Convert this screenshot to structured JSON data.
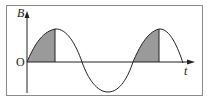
{
  "figure": {
    "y_axis_label": "B",
    "x_axis_label": "t",
    "origin_label": "O",
    "curve": "sine wave",
    "shaded_regions": [
      {
        "from": "0",
        "to": "T/4",
        "description": "first quarter period, B rising from 0 to maximum"
      },
      {
        "from": "T",
        "to": "5T/4",
        "description": "quarter period after one full cycle, B rising from 0 to maximum"
      }
    ],
    "colors": {
      "line": "#222222",
      "shade": "#9a9a9a",
      "frame": "#888888",
      "background": "#ffffff"
    }
  }
}
